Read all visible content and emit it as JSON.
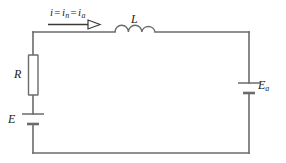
{
  "figure": {
    "type": "schematic",
    "name": "series-rl-circuit-with-two-sources",
    "background_color": "#ffffff",
    "wire_color": "#6b6b6b",
    "text_color": "#1a1a1a"
  },
  "labels": {
    "resistor": "R",
    "inductor": "L",
    "source_left": "E",
    "source_right_base": "E",
    "source_right_sub": "a",
    "current_i": "i",
    "current_eq1": "=",
    "current_in_base": "i",
    "current_in_sub": "n",
    "current_eq2": "=",
    "current_ia_base": "i",
    "current_ia_sub": "a"
  },
  "components": [
    {
      "name": "resistor",
      "symbol": "rectangle-box",
      "label": "R",
      "orientation": "vertical",
      "side": "left-branch"
    },
    {
      "name": "inductor",
      "symbol": "three-arc-coil",
      "label": "L",
      "orientation": "horizontal",
      "side": "top-branch",
      "arc_count": 3
    },
    {
      "name": "battery-left",
      "symbol": "battery-two-plate",
      "label": "E",
      "orientation": "vertical",
      "side": "left-branch",
      "long_plate": "top",
      "short_plate": "bottom"
    },
    {
      "name": "battery-right",
      "symbol": "battery-two-plate",
      "label": "Ea",
      "orientation": "vertical",
      "side": "right-branch",
      "long_plate": "top",
      "short_plate": "bottom"
    },
    {
      "name": "current-arrow",
      "symbol": "arrow-right-open-head",
      "direction": "right",
      "side": "top-branch"
    }
  ],
  "loop": {
    "left_x": 33,
    "right_x": 249,
    "top_y": 32,
    "bottom_y": 153
  }
}
